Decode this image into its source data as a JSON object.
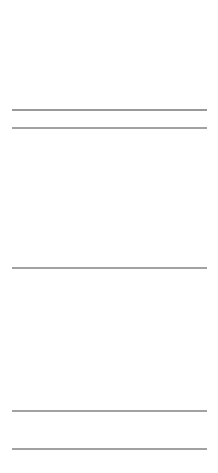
{
  "chart_data": [
    {
      "type": "line",
      "title": "",
      "description": "DNA sequencing chromatogram (four-channel trace), grayscale",
      "xlabel": "",
      "ylabel": "",
      "x_range": [
        12,
        207
      ],
      "baseline_y": 110,
      "tick_labels": [
        {
          "text": "130",
          "x": 86
        },
        {
          "text": "14",
          "x": 200
        }
      ],
      "grid": false,
      "series": [
        {
          "name": "channel-dark",
          "color": "#222222",
          "peaks": [
            {
              "x": 21,
              "h": 49
            },
            {
              "x": 54,
              "h": 61
            },
            {
              "x": 89,
              "h": 39
            },
            {
              "x": 113,
              "h": 54
            },
            {
              "x": 136,
              "h": 48
            },
            {
              "x": 158,
              "h": 77
            },
            {
              "x": 193,
              "h": 52
            }
          ]
        },
        {
          "name": "channel-mid",
          "color": "#666666",
          "peaks": [
            {
              "x": 43,
              "h": 74
            },
            {
              "x": 124,
              "h": 42
            },
            {
              "x": 169,
              "h": 36
            }
          ]
        },
        {
          "name": "channel-light",
          "color": "#9a9a9a",
          "peaks": [
            {
              "x": 33,
              "h": 66
            },
            {
              "x": 67,
              "h": 73
            },
            {
              "x": 78,
              "h": 60
            },
            {
              "x": 102,
              "h": 87
            },
            {
              "x": 148,
              "h": 43
            },
            {
              "x": 182,
              "h": 88
            },
            {
              "x": 206,
              "h": 65
            }
          ]
        }
      ]
    },
    {
      "type": "line",
      "description": "Derivative / difference trace with bidirectional spikes about a centre baseline",
      "x_range": [
        12,
        207
      ],
      "top_line_y": 128,
      "center_y": 268,
      "bottom_line_y": 411,
      "extra_line_y": 449,
      "spikes": [
        {
          "x": 18,
          "up": 110,
          "down": 60,
          "c": "#444"
        },
        {
          "x": 22,
          "up": 140,
          "down": 140,
          "c": "#222"
        },
        {
          "x": 28,
          "up": 90,
          "down": 125,
          "c": "#999"
        },
        {
          "x": 31,
          "up": 140,
          "down": 140,
          "c": "#888"
        },
        {
          "x": 34,
          "up": 120,
          "down": 140,
          "c": "#aaa"
        },
        {
          "x": 38,
          "up": 80,
          "down": 40,
          "c": "#666"
        },
        {
          "x": 44,
          "up": 140,
          "down": 60,
          "c": "#222"
        },
        {
          "x": 51,
          "up": 140,
          "down": 80,
          "c": "#111"
        },
        {
          "x": 48,
          "up": 60,
          "down": 100,
          "c": "#aaa"
        },
        {
          "x": 67,
          "up": 140,
          "down": 140,
          "c": "#aaa"
        },
        {
          "x": 70,
          "up": 140,
          "down": 110,
          "c": "#bbb"
        },
        {
          "x": 87,
          "up": 110,
          "down": 140,
          "c": "#333"
        },
        {
          "x": 92,
          "up": 80,
          "down": 100,
          "c": "#666"
        },
        {
          "x": 100,
          "up": 140,
          "down": 140,
          "c": "#bbb"
        },
        {
          "x": 104,
          "up": 140,
          "down": 140,
          "c": "#aaa"
        },
        {
          "x": 107,
          "up": 140,
          "down": 140,
          "c": "#222"
        },
        {
          "x": 116,
          "up": 140,
          "down": 140,
          "c": "#111"
        },
        {
          "x": 127,
          "up": 30,
          "down": 20,
          "c": "#888"
        },
        {
          "x": 136,
          "up": 140,
          "down": 140,
          "c": "#111"
        },
        {
          "x": 146,
          "up": 140,
          "down": 140,
          "c": "#333"
        },
        {
          "x": 149,
          "up": 140,
          "down": 70,
          "c": "#999"
        },
        {
          "x": 157,
          "up": 140,
          "down": 70,
          "c": "#111"
        },
        {
          "x": 160,
          "up": 140,
          "down": 20,
          "c": "#333"
        },
        {
          "x": 165,
          "up": 40,
          "down": 30,
          "c": "#777"
        },
        {
          "x": 179,
          "up": 140,
          "down": 100,
          "c": "#aaa"
        },
        {
          "x": 183,
          "up": 140,
          "down": 140,
          "c": "#888"
        },
        {
          "x": 194,
          "up": 140,
          "down": 110,
          "c": "#111"
        },
        {
          "x": 199,
          "up": 40,
          "down": 50,
          "c": "#666"
        },
        {
          "x": 205,
          "up": 140,
          "down": 140,
          "c": "#aaa"
        }
      ]
    }
  ],
  "labels": {
    "tick_130": "130",
    "tick_14": "14"
  }
}
